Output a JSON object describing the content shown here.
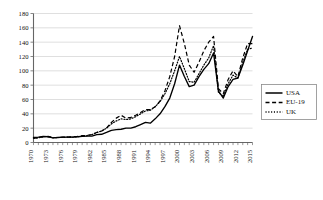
{
  "chart_data": {
    "type": "line",
    "title": "",
    "subtitle": "",
    "xlabel": "",
    "ylabel": "",
    "xlim": [
      1970,
      2015
    ],
    "ylim": [
      0,
      180
    ],
    "ytick_step": 20,
    "ytick_labels": [
      "0",
      "20",
      "40",
      "60",
      "80",
      "100",
      "120",
      "140",
      "160",
      "180"
    ],
    "xtick_labels": [
      "1970",
      "1973",
      "1976",
      "1979",
      "1982",
      "1985",
      "1988",
      "1991",
      "1994",
      "1997",
      "2000",
      "2003",
      "2006",
      "2009",
      "2012",
      "2015"
    ],
    "xtick_label_interval_years": 3,
    "minor_ticks_every_year": true,
    "grid": "horizontal",
    "legend_position": "right",
    "x": [
      1970,
      1971,
      1972,
      1973,
      1974,
      1975,
      1976,
      1977,
      1978,
      1979,
      1980,
      1981,
      1982,
      1983,
      1984,
      1985,
      1986,
      1987,
      1988,
      1989,
      1990,
      1991,
      1992,
      1993,
      1994,
      1995,
      1996,
      1997,
      1998,
      1999,
      2000,
      2001,
      2002,
      2003,
      2004,
      2005,
      2006,
      2007,
      2008,
      2009,
      2010,
      2011,
      2012,
      2013,
      2014,
      2015
    ],
    "series": [
      {
        "name": "USA",
        "style": "solid",
        "color": "#000000",
        "values": [
          7,
          7.5,
          8.5,
          8,
          6.5,
          7,
          7.5,
          7.5,
          7.5,
          8,
          8.5,
          9,
          9,
          11,
          11.5,
          14,
          17,
          18,
          18.5,
          20,
          20,
          22,
          25,
          28,
          27,
          33,
          40,
          50,
          62,
          82,
          108,
          92,
          78,
          80,
          92,
          102,
          110,
          125,
          72,
          62,
          78,
          88,
          90,
          108,
          128,
          148
        ]
      },
      {
        "name": "EU-19",
        "style": "dashed",
        "color": "#000000",
        "values": [
          6,
          6.5,
          8,
          8.5,
          7,
          7,
          7.5,
          7.5,
          8,
          8.5,
          9.5,
          10,
          11,
          14,
          16,
          20,
          28,
          34,
          38,
          34,
          35,
          38,
          42,
          46,
          46,
          50,
          58,
          72,
          92,
          120,
          163,
          138,
          108,
          98,
          112,
          128,
          140,
          148,
          75,
          68,
          88,
          100,
          92,
          118,
          138,
          138
        ]
      },
      {
        "name": "UK",
        "style": "dotted",
        "color": "#000000",
        "values": [
          6,
          6.5,
          8,
          8,
          6.5,
          7,
          7,
          7.5,
          7.5,
          8,
          8.5,
          9.5,
          11,
          14,
          16,
          20,
          26,
          30,
          33,
          32,
          33,
          36,
          40,
          44,
          45,
          50,
          57,
          68,
          82,
          100,
          120,
          103,
          85,
          84,
          96,
          108,
          118,
          135,
          70,
          64,
          82,
          94,
          90,
          112,
          130,
          132
        ]
      }
    ]
  },
  "legend": {
    "items": [
      {
        "label": "USA",
        "style": "solid"
      },
      {
        "label": "EU-19",
        "style": "dashed"
      },
      {
        "label": "UK",
        "style": "dotted"
      }
    ]
  }
}
